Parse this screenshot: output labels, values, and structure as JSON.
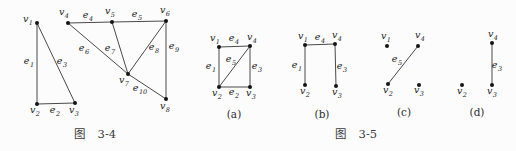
{
  "page": {
    "background": "#fcfcfc",
    "line_color": "#4a4a4a",
    "dot_color": "#141414",
    "text_color": "#222222"
  },
  "figures": [
    {
      "id": "fig-3-4",
      "caption": "图 3-4",
      "caption_pos": {
        "x": 95,
        "y": 133
      },
      "graphs": [
        {
          "sub_caption": "",
          "sub_caption_pos": {
            "x": 0,
            "y": 0
          },
          "vertices": [
            {
              "id": "v1",
              "base": "v",
              "sub": "1",
              "x": 37,
              "y": 23,
              "lx": 28,
              "ly": 20
            },
            {
              "id": "v2",
              "base": "v",
              "sub": "2",
              "x": 37,
              "y": 104,
              "lx": 35,
              "ly": 111
            },
            {
              "id": "v3",
              "base": "v",
              "sub": "3",
              "x": 75,
              "y": 103,
              "lx": 74,
              "ly": 111
            },
            {
              "id": "v4",
              "base": "v",
              "sub": "4",
              "x": 68,
              "y": 23,
              "lx": 64,
              "ly": 13
            },
            {
              "id": "v5",
              "base": "v",
              "sub": "5",
              "x": 112,
              "y": 22,
              "lx": 110,
              "ly": 12
            },
            {
              "id": "v6",
              "base": "v",
              "sub": "6",
              "x": 166,
              "y": 21,
              "lx": 165,
              "ly": 11
            },
            {
              "id": "v7",
              "base": "v",
              "sub": "7",
              "x": 128,
              "y": 74,
              "lx": 124,
              "ly": 81
            },
            {
              "id": "v8",
              "base": "v",
              "sub": "8",
              "x": 166,
              "y": 99,
              "lx": 165,
              "ly": 107
            }
          ],
          "edges": [
            {
              "id": "e1",
              "base": "e",
              "sub": "1",
              "from": "v1",
              "to": "v2",
              "lx": 29,
              "ly": 62
            },
            {
              "id": "e2",
              "base": "e",
              "sub": "2",
              "from": "v2",
              "to": "v3",
              "lx": 55,
              "ly": 111
            },
            {
              "id": "e3",
              "base": "e",
              "sub": "3",
              "from": "v1",
              "to": "v3",
              "lx": 62,
              "ly": 62
            },
            {
              "id": "e4",
              "base": "e",
              "sub": "4",
              "from": "v4",
              "to": "v5",
              "lx": 88,
              "ly": 16
            },
            {
              "id": "e5",
              "base": "e",
              "sub": "5",
              "from": "v5",
              "to": "v6",
              "lx": 137,
              "ly": 15
            },
            {
              "id": "e6",
              "base": "e",
              "sub": "6",
              "from": "v4",
              "to": "v7",
              "lx": 84,
              "ly": 49
            },
            {
              "id": "e7",
              "base": "e",
              "sub": "7",
              "from": "v5",
              "to": "v7",
              "lx": 110,
              "ly": 49
            },
            {
              "id": "e8",
              "base": "e",
              "sub": "8",
              "from": "v7",
              "to": "v6",
              "lx": 154,
              "ly": 48
            },
            {
              "id": "e9",
              "base": "e",
              "sub": "9",
              "from": "v6",
              "to": "v8",
              "lx": 174,
              "ly": 47
            },
            {
              "id": "e10",
              "base": "e",
              "sub": "10",
              "from": "v7",
              "to": "v8",
              "lx": 140,
              "ly": 89
            }
          ]
        }
      ]
    },
    {
      "id": "fig-3-5",
      "caption": "图 3-5",
      "caption_pos": {
        "x": 356,
        "y": 133
      },
      "graphs": [
        {
          "sub_caption": "(a)",
          "sub_caption_pos": {
            "x": 234,
            "y": 114
          },
          "vertices": [
            {
              "id": "v1",
              "base": "v",
              "sub": "1",
              "x": 219,
              "y": 47,
              "lx": 215,
              "ly": 39
            },
            {
              "id": "v4",
              "base": "v",
              "sub": "4",
              "x": 250,
              "y": 46,
              "lx": 252,
              "ly": 38
            },
            {
              "id": "v2",
              "base": "v",
              "sub": "2",
              "x": 219,
              "y": 87,
              "lx": 217,
              "ly": 94
            },
            {
              "id": "v3",
              "base": "v",
              "sub": "3",
              "x": 250,
              "y": 87,
              "lx": 251,
              "ly": 94
            }
          ],
          "edges": [
            {
              "id": "e4",
              "base": "e",
              "sub": "4",
              "from": "v1",
              "to": "v4",
              "lx": 234,
              "ly": 39
            },
            {
              "id": "e1",
              "base": "e",
              "sub": "1",
              "from": "v1",
              "to": "v2",
              "lx": 211,
              "ly": 67
            },
            {
              "id": "e3",
              "base": "e",
              "sub": "3",
              "from": "v4",
              "to": "v3",
              "lx": 257,
              "ly": 67
            },
            {
              "id": "e2",
              "base": "e",
              "sub": "2",
              "from": "v2",
              "to": "v3",
              "lx": 234,
              "ly": 93
            },
            {
              "id": "e5",
              "base": "e",
              "sub": "5",
              "from": "v4",
              "to": "v2",
              "lx": 231,
              "ly": 60
            }
          ]
        },
        {
          "sub_caption": "(b)",
          "sub_caption_pos": {
            "x": 322,
            "y": 114
          },
          "vertices": [
            {
              "id": "v1",
              "base": "v",
              "sub": "1",
              "x": 305,
              "y": 45,
              "lx": 303,
              "ly": 37
            },
            {
              "id": "v4",
              "base": "v",
              "sub": "4",
              "x": 335,
              "y": 44,
              "lx": 337,
              "ly": 36
            },
            {
              "id": "v2",
              "base": "v",
              "sub": "2",
              "x": 305,
              "y": 85,
              "lx": 305,
              "ly": 92
            },
            {
              "id": "v3",
              "base": "v",
              "sub": "3",
              "x": 336,
              "y": 86,
              "lx": 337,
              "ly": 93
            }
          ],
          "edges": [
            {
              "id": "e4",
              "base": "e",
              "sub": "4",
              "from": "v1",
              "to": "v4",
              "lx": 320,
              "ly": 38
            },
            {
              "id": "e1",
              "base": "e",
              "sub": "1",
              "from": "v1",
              "to": "v2",
              "lx": 297,
              "ly": 66
            },
            {
              "id": "e3",
              "base": "e",
              "sub": "3",
              "from": "v4",
              "to": "v3",
              "lx": 342,
              "ly": 67
            }
          ]
        },
        {
          "sub_caption": "(c)",
          "sub_caption_pos": {
            "x": 404,
            "y": 112
          },
          "vertices": [
            {
              "id": "v1",
              "base": "v",
              "sub": "1",
              "x": 387,
              "y": 46,
              "lx": 386,
              "ly": 37
            },
            {
              "id": "v4",
              "base": "v",
              "sub": "4",
              "x": 418,
              "y": 46,
              "lx": 420,
              "ly": 36
            },
            {
              "id": "v2",
              "base": "v",
              "sub": "2",
              "x": 388,
              "y": 84,
              "lx": 388,
              "ly": 91
            },
            {
              "id": "v3",
              "base": "v",
              "sub": "3",
              "x": 419,
              "y": 85,
              "lx": 419,
              "ly": 91
            }
          ],
          "edges": [
            {
              "id": "e5",
              "base": "e",
              "sub": "5",
              "from": "v4",
              "to": "v2",
              "lx": 397,
              "ly": 60
            }
          ]
        },
        {
          "sub_caption": "(d)",
          "sub_caption_pos": {
            "x": 477,
            "y": 112
          },
          "vertices": [
            {
              "id": "v4",
              "base": "v",
              "sub": "4",
              "x": 492,
              "y": 43,
              "lx": 493,
              "ly": 35
            },
            {
              "id": "v2",
              "base": "v",
              "sub": "2",
              "x": 462,
              "y": 85,
              "lx": 462,
              "ly": 92
            },
            {
              "id": "v3",
              "base": "v",
              "sub": "3",
              "x": 492,
              "y": 85,
              "lx": 492,
              "ly": 92
            }
          ],
          "edges": [
            {
              "id": "e3",
              "base": "e",
              "sub": "3",
              "from": "v4",
              "to": "v3",
              "lx": 497,
              "ly": 66
            }
          ]
        }
      ]
    }
  ]
}
